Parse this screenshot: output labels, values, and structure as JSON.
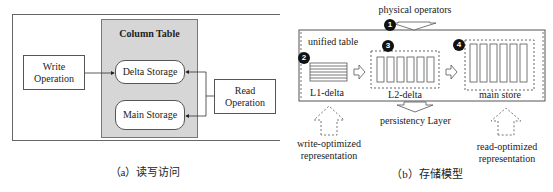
{
  "panel_a": {
    "caption": "（a）读写访问",
    "column_table": {
      "title": "Column Table",
      "fill": "#d6d6d6"
    },
    "delta_storage": "Delta Storage",
    "main_storage": "Main Storage",
    "write_operation": [
      "Write",
      "Operation"
    ],
    "read_operation": [
      "Read",
      "Operation"
    ]
  },
  "panel_b": {
    "caption": "（b）存储模型",
    "physical_operators": "physical operators",
    "unified_table": "unified table",
    "l1_delta": "L1-delta",
    "l2_delta": "L2-delta",
    "main_store": "main store",
    "persistency_layer": "persistency Layer",
    "write_optimized": [
      "write-optimized",
      "representation"
    ],
    "read_optimized": [
      "read-optimized",
      "representation"
    ],
    "badges": [
      "1",
      "2",
      "3",
      "4"
    ]
  }
}
